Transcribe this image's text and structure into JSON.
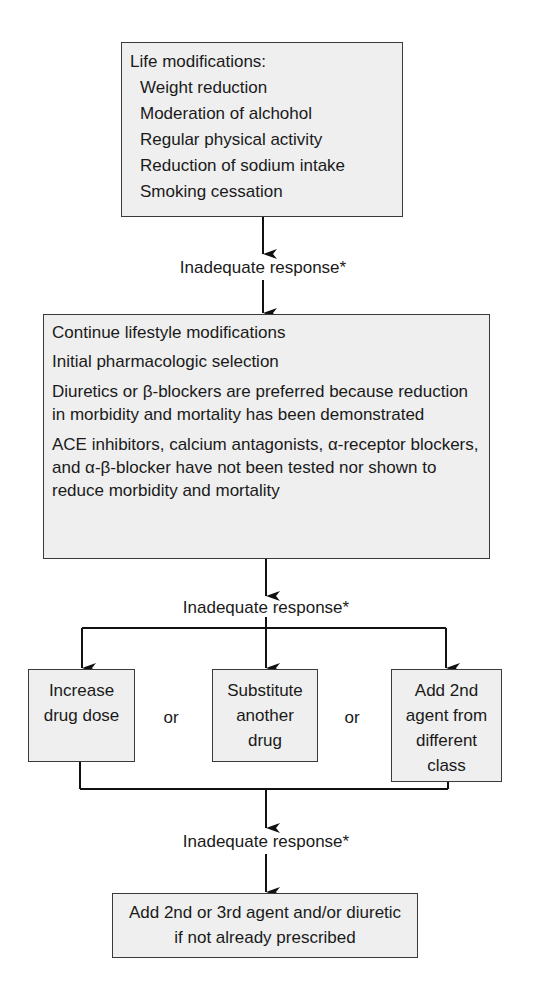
{
  "box1": {
    "title": "Life modifications:",
    "items": [
      "Weight reduction",
      "Moderation of alchohol",
      "Regular physical activity",
      "Reduction of sodium intake",
      "Smoking cessation"
    ]
  },
  "response_label_1": "Inadequate response*",
  "box2": {
    "line1": "Continue lifestyle modifications",
    "line2": "Initial pharmacologic selection",
    "line3": "Diuretics or β-blockers are preferred because reduction in morbidity and mortality has been demonstrated",
    "line4": "ACE inhibitors, calcium antagonists, α-receptor blockers, and  α-β-blocker have not been tested nor shown to reduce morbidity and mortality"
  },
  "response_label_2": "Inadequate response*",
  "options": [
    {
      "label": "Increase drug dose"
    },
    {
      "label": "Substitute another drug"
    },
    {
      "label": "Add 2nd agent from different class"
    }
  ],
  "or_label": "or",
  "response_label_3": "Inadequate response*",
  "box_final": "Add 2nd or 3rd agent and/or diuretic if not already prescribed",
  "colors": {
    "box_fill": "#efefef",
    "stroke": "#1a1a1a"
  }
}
